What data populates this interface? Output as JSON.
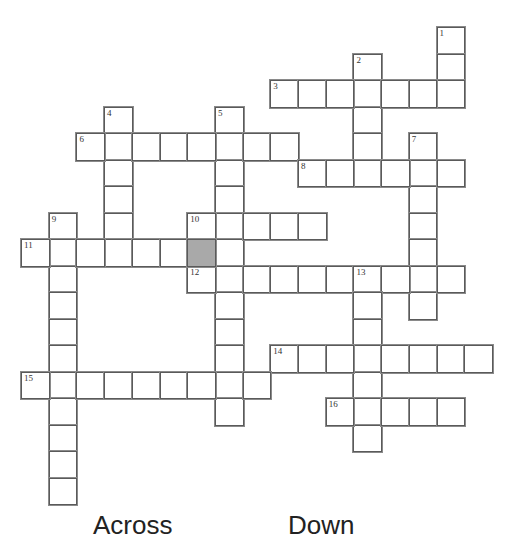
{
  "puzzle": {
    "type": "crossword",
    "grid_origin": {
      "x": 21,
      "y": 27
    },
    "cell_size": {
      "w": 27.7,
      "h": 26.5
    },
    "colors": {
      "border": "#5a5a5a",
      "shaded": "#a9a9a9",
      "background": "#ffffff"
    },
    "shaded_cells": [
      [
        8,
        6
      ]
    ],
    "words": [
      {
        "number": 1,
        "direction": "down",
        "row": 0,
        "col": 15,
        "length": 3
      },
      {
        "number": 2,
        "direction": "down",
        "row": 1,
        "col": 12,
        "length": 5
      },
      {
        "number": 3,
        "direction": "across",
        "row": 2,
        "col": 9,
        "length": 7
      },
      {
        "number": 4,
        "direction": "down",
        "row": 3,
        "col": 3,
        "length": 6
      },
      {
        "number": 5,
        "direction": "down",
        "row": 3,
        "col": 7,
        "length": 12
      },
      {
        "number": 6,
        "direction": "across",
        "row": 4,
        "col": 2,
        "length": 8
      },
      {
        "number": 7,
        "direction": "down",
        "row": 4,
        "col": 14,
        "length": 7
      },
      {
        "number": 8,
        "direction": "across",
        "row": 5,
        "col": 10,
        "length": 6
      },
      {
        "number": 9,
        "direction": "down",
        "row": 7,
        "col": 1,
        "length": 11
      },
      {
        "number": 10,
        "direction": "across",
        "row": 7,
        "col": 6,
        "length": 5
      },
      {
        "number": 11,
        "direction": "across",
        "row": 8,
        "col": 0,
        "length": 6
      },
      {
        "number": 12,
        "direction": "across",
        "row": 9,
        "col": 6,
        "length": 10
      },
      {
        "number": 13,
        "direction": "down",
        "row": 9,
        "col": 12,
        "length": 7
      },
      {
        "number": 14,
        "direction": "across",
        "row": 12,
        "col": 9,
        "length": 8
      },
      {
        "number": 15,
        "direction": "across",
        "row": 13,
        "col": 0,
        "length": 9
      },
      {
        "number": 16,
        "direction": "across",
        "row": 14,
        "col": 11,
        "length": 5
      }
    ]
  },
  "clues": {
    "across_heading": "Across",
    "down_heading": "Down"
  }
}
